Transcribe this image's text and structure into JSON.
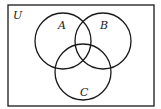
{
  "diagram": {
    "type": "venn",
    "universe_label": "U",
    "sets": [
      {
        "label": "A",
        "cx": 63,
        "cy": 41,
        "r": 28,
        "label_x": 58,
        "label_y": 29
      },
      {
        "label": "B",
        "cx": 103,
        "cy": 41,
        "r": 28,
        "label_x": 100,
        "label_y": 29
      },
      {
        "label": "C",
        "cx": 83,
        "cy": 72,
        "r": 28,
        "label_x": 80,
        "label_y": 96
      }
    ],
    "universe": {
      "x": 8,
      "y": 5,
      "width": 146,
      "height": 101,
      "label_x": 13,
      "label_y": 19
    },
    "stroke_color": "#1a1a1a"
  }
}
